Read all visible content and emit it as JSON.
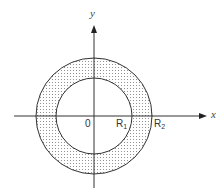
{
  "diagram": {
    "title": "",
    "axes": {
      "x_label": "x",
      "y_label": "y",
      "origin_label": "0"
    },
    "circles": [
      {
        "name": "inner",
        "label_main": "R",
        "label_sub": "1",
        "radius_px": 38
      },
      {
        "name": "outer",
        "label_main": "R",
        "label_sub": "2",
        "radius_px": 58
      }
    ],
    "center_px": {
      "x": 94,
      "y": 116
    },
    "colors": {
      "line": "#333333",
      "fill_dots": "#777777",
      "background": "#ffffff"
    }
  }
}
